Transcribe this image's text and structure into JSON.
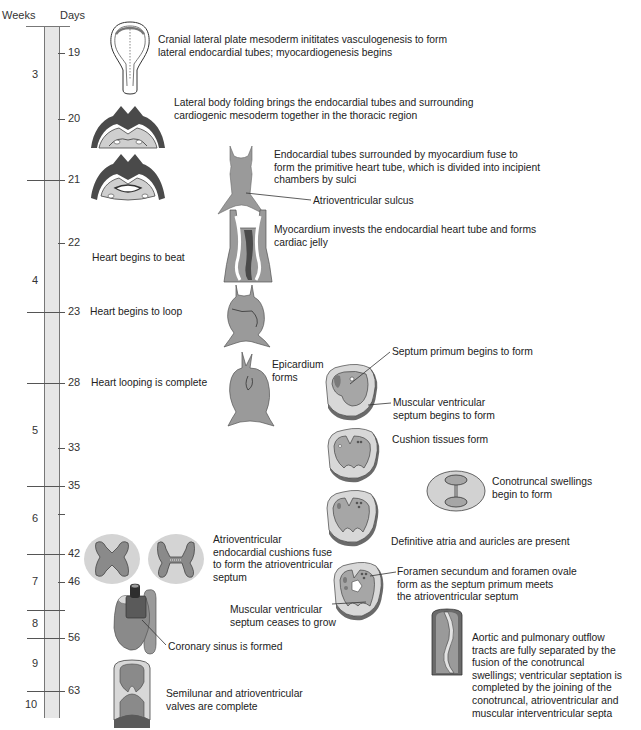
{
  "header": {
    "weeks_label": "Weeks",
    "days_label": "Days"
  },
  "timeline": {
    "weeks": [
      {
        "label": "3",
        "y": 75
      },
      {
        "label": "4",
        "y": 281
      },
      {
        "label": "5",
        "y": 431
      },
      {
        "label": "6",
        "y": 519
      },
      {
        "label": "7",
        "y": 582
      },
      {
        "label": "8",
        "y": 624
      },
      {
        "label": "9",
        "y": 664
      },
      {
        "label": "10",
        "y": 705
      }
    ],
    "days": [
      {
        "label": "19",
        "y": 53
      },
      {
        "label": "20",
        "y": 119
      },
      {
        "label": "21",
        "y": 180
      },
      {
        "label": "22",
        "y": 243
      },
      {
        "label": "23",
        "y": 312
      },
      {
        "label": "28",
        "y": 383
      },
      {
        "label": "33",
        "y": 448
      },
      {
        "label": "35",
        "y": 486
      },
      {
        "label": "42",
        "y": 554
      },
      {
        "label": "46",
        "y": 582
      },
      {
        "label": "56",
        "y": 638
      },
      {
        "label": "63",
        "y": 691
      }
    ],
    "week_boundaries_y": [
      180,
      312,
      383,
      486,
      554,
      610,
      638,
      691
    ],
    "minor_day_ticks_y": [
      514
    ]
  },
  "events": {
    "day19": "Cranial lateral plate mesoderm inititates vasculogenesis to form\nlateral endocardial tubes; myocardiogenesis begins",
    "day20": "Lateral body folding brings the endocardial tubes and surrounding\ncardiogenic mesoderm together in the thoracic region",
    "day21": "Endocardial tubes surrounded by myocardium fuse to\nform the primitive heart tube, which is divided into incipient\nchambers by sulci",
    "av_sulcus": "Atrioventricular sulcus",
    "myocardium": "Myocardium invests the endocardial heart tube and forms\ncardiac jelly",
    "heart_beat": "Heart begins to beat",
    "heart_loop": "Heart begins to loop",
    "loop_complete": "Heart looping is complete",
    "epicardium": "Epicardium\nforms",
    "septum_primum": "Septum primum begins to form",
    "muscular_septum_begins": "Muscular ventricular\nseptum begins to form",
    "cushion_tissues": "Cushion tissues form",
    "conotruncal": "Conotruncal swellings\nbegin to form",
    "definitive_atria": "Definitive atria and auricles are present",
    "av_cushions": "Atrioventricular\nendocardial cushions fuse\nto form the atrioventricular\nseptum",
    "foramen": "Foramen secundum and foramen ovale\nform as the septum primum meets\nthe atrioventricular septum",
    "muscular_septum_stops": "Muscular ventricular\nseptum ceases to grow",
    "coronary_sinus": "Coronary sinus is formed",
    "outflow": "Aortic and pulmonary outflow\ntracts are fully separated by the\nfusion of the conotruncal\nswellings; ventricular septation is\ncompleted by the joining of the\nconotruncal, atrioventricular and\nmuscular interventricular septa",
    "valves": "Semilunar and atrioventricular\nvalves are complete"
  },
  "colors": {
    "dark_tissue": "#4a4a4a",
    "mid_tissue": "#8a8a8a",
    "light_tissue": "#bdbdbd",
    "pale_tissue": "#dcdcdc",
    "ruler_fill": "#e6e6e6"
  }
}
